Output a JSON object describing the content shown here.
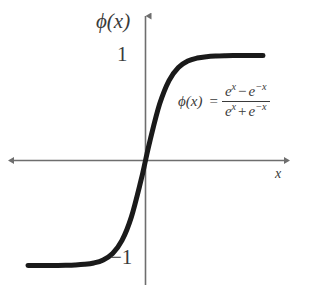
{
  "figure": {
    "background_color": "#ffffff",
    "axis_color": "#6e6e6e",
    "curve_color": "#1a1a1a",
    "text_color": "#3a3a3a",
    "y_axis_label": "ϕ(x)",
    "x_axis_label": "x",
    "tick_labels": {
      "positive_one": "1",
      "negative_one": "−1"
    },
    "equation": {
      "lhs": "ϕ(x)",
      "equals": "=",
      "numerator": {
        "term1_base": "e",
        "term1_exp": "x",
        "operator": "−",
        "term2_base": "e",
        "term2_exp": "−x"
      },
      "denominator": {
        "term1_base": "e",
        "term1_exp": "x",
        "operator": "+",
        "term2_base": "e",
        "term2_exp": "−x"
      },
      "plain_text": "ϕ(x) = (e^x − e^−x) / (e^x + e^−x)"
    }
  },
  "chart_data": {
    "type": "line",
    "title": "",
    "subtitle": "",
    "xlabel": "x",
    "ylabel": "ϕ(x)",
    "function": "tanh(x) = (e^x - e^-x)/(e^x + e^-x)",
    "grid": false,
    "legend": null,
    "xlim": [
      -5,
      5
    ],
    "ylim": [
      -1.35,
      1.35
    ],
    "xticks": [],
    "yticks": [
      -1,
      1
    ],
    "ytick_labels": [
      "−1",
      "1"
    ],
    "annotations": [
      {
        "text": "ϕ(x) = (e^x − e^−x) / (e^x + e^−x)",
        "x": 1.2,
        "y": 0.55
      }
    ],
    "series": [
      {
        "name": "ϕ(x)",
        "color": "#1a1a1a",
        "linewidth": 5,
        "x": [
          -5.0,
          -4.6,
          -4.2,
          -3.8,
          -3.4,
          -3.0,
          -2.6,
          -2.2,
          -1.8,
          -1.4,
          -1.0,
          -0.6,
          -0.2,
          0.0,
          0.2,
          0.6,
          1.0,
          1.4,
          1.8,
          2.2,
          2.6,
          3.0,
          3.4,
          3.8,
          4.2,
          4.6,
          5.0
        ],
        "y": [
          -0.9999,
          -0.9998,
          -0.9996,
          -0.999,
          -0.9978,
          -0.9951,
          -0.989,
          -0.9757,
          -0.9468,
          -0.8854,
          -0.7616,
          -0.537,
          -0.1974,
          0.0,
          0.1974,
          0.537,
          0.7616,
          0.8854,
          0.9468,
          0.9757,
          0.989,
          0.9951,
          0.9978,
          0.999,
          0.9996,
          0.9998,
          0.9999
        ]
      }
    ]
  }
}
